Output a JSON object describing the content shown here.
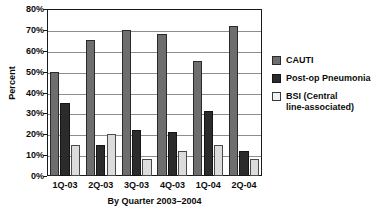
{
  "chart_data": {
    "type": "bar",
    "title": "",
    "xlabel": "By Quarter 2003–2004",
    "ylabel": "Percent",
    "categories": [
      "1Q-03",
      "2Q-03",
      "3Q-03",
      "4Q-03",
      "1Q-04",
      "2Q-04"
    ],
    "series": [
      {
        "name": "CAUTI",
        "values": [
          50,
          65,
          70,
          68,
          55,
          72
        ],
        "color": "#6e6e6e"
      },
      {
        "name": "Post-op Pneumonia",
        "values": [
          35,
          15,
          22,
          21,
          31,
          12
        ],
        "color": "#2b2b2b"
      },
      {
        "name": "BSI (Central line-associated)",
        "values": [
          15,
          20,
          8,
          12,
          15,
          8
        ],
        "color": "#dcdcdc"
      }
    ],
    "ylim": [
      0,
      80
    ],
    "ytick_values": [
      0,
      10,
      20,
      30,
      40,
      50,
      60,
      70,
      80
    ],
    "ytick_labels": [
      "0%",
      "10%",
      "20%",
      "30%",
      "40%",
      "50%",
      "60%",
      "70%",
      "80%"
    ],
    "grid": true,
    "legend_position": "right"
  },
  "legend": {
    "entries": [
      {
        "label": "CAUTI"
      },
      {
        "label": "Post-op Pneumonia"
      },
      {
        "label": "BSI (Central",
        "label2": "line-associated)"
      }
    ]
  }
}
